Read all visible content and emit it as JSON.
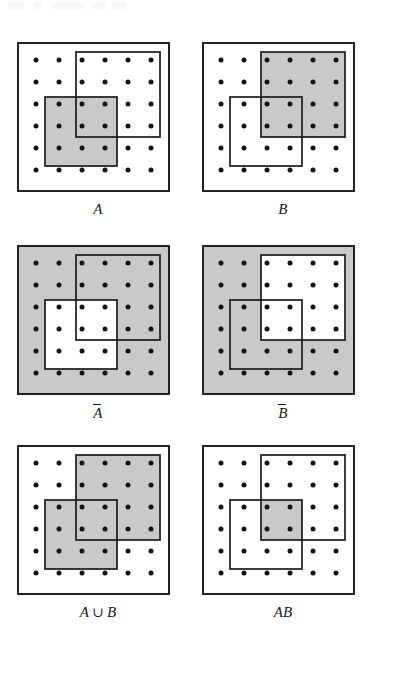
{
  "figure": {
    "kind": "venn-style set diagram grid",
    "grid": {
      "rows": 3,
      "columns": 2
    },
    "panel": {
      "outer_box_label": "sample space S",
      "dot_grid": {
        "rows": 6,
        "columns": 6,
        "total_points": 36
      },
      "rect_a_name": "A",
      "rect_b_name": "B"
    },
    "colors": {
      "ink": "#1a1a1a",
      "shade": "#c9c9c9",
      "paper": "#ffffff",
      "dot": "#141414"
    },
    "panels": [
      {
        "id": "panel-a",
        "label": "A",
        "label_parts": [
          {
            "text": "A",
            "overline": false
          }
        ],
        "shading": "A only",
        "shade_regions": [
          "A"
        ],
        "shaded_points": 9
      },
      {
        "id": "panel-b",
        "label": "B",
        "label_parts": [
          {
            "text": "B",
            "overline": false
          }
        ],
        "shading": "B only",
        "shade_regions": [
          "B"
        ],
        "shaded_points": 12
      },
      {
        "id": "panel-a-complement",
        "label": "Ā",
        "label_parts": [
          {
            "text": "A",
            "overline": true
          }
        ],
        "shading": "complement of A",
        "shade_regions": [
          "S minus A"
        ],
        "shaded_points": 27
      },
      {
        "id": "panel-b-complement",
        "label": "B̄",
        "label_parts": [
          {
            "text": "B",
            "overline": true
          }
        ],
        "shading": "complement of B",
        "shade_regions": [
          "S minus B"
        ],
        "shaded_points": 24
      },
      {
        "id": "panel-a-union-b",
        "label": "A ∪ B",
        "label_parts": [
          {
            "text": "A",
            "overline": false
          },
          {
            "text": "∪",
            "operator": true
          },
          {
            "text": "B",
            "overline": false
          }
        ],
        "shading": "union of A and B",
        "shade_regions": [
          "A",
          "B"
        ],
        "shaded_points": 17
      },
      {
        "id": "panel-ab",
        "label": "AB",
        "label_parts": [
          {
            "text": "AB",
            "overline": false
          }
        ],
        "shading": "intersection of A and B",
        "shade_regions": [
          "A intersect B"
        ],
        "shaded_points": 4
      }
    ]
  }
}
